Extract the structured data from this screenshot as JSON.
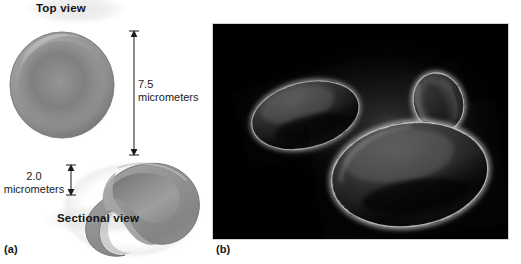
{
  "figure": {
    "type": "textbook-figure",
    "background_color": "#ffffff"
  },
  "panel_a": {
    "label": "(a)",
    "kind": "illustration",
    "top_view": {
      "caption": "Top view",
      "shape": "biconcave disc seen face-on",
      "fill_color": "#8c8c8c",
      "rim_color": "#a7a7a7",
      "center_color": "#787878"
    },
    "sectional_view": {
      "caption": "Sectional view",
      "shape": "biconcave disc cut away",
      "outer_color": "#8f8f8f",
      "cut_face_color": "#a3a3a3"
    },
    "dimensions": [
      {
        "name": "diameter",
        "value": "7.5",
        "unit": "micrometers",
        "orientation": "vertical",
        "applies_to": "top-view"
      },
      {
        "name": "thickness",
        "value": "2.0",
        "unit": "micrometers",
        "orientation": "vertical",
        "applies_to": "sectional-view"
      }
    ],
    "arrow_color": "#1a1a1a"
  },
  "panel_b": {
    "label": "(b)",
    "kind": "micrograph",
    "description": "Scanning electron micrograph of three red blood cells",
    "background_color": "#000000",
    "border_color": "#d2d2d2",
    "cells": [
      {
        "name": "upper-left-cell",
        "orientation": "tilted face view",
        "relative_size": "medium"
      },
      {
        "name": "top-right-cell",
        "orientation": "edge-on view",
        "relative_size": "small"
      },
      {
        "name": "lower-right-cell",
        "orientation": "face view",
        "relative_size": "large"
      }
    ]
  }
}
